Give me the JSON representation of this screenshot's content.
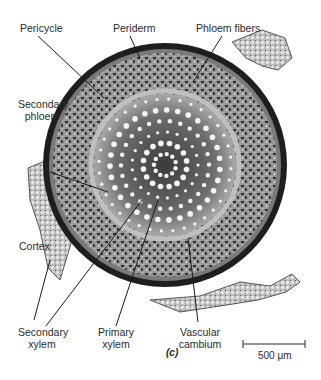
{
  "figure": {
    "panel_label": "(c)",
    "labels": {
      "pericycle": "Pericycle",
      "periderm": "Periderm",
      "phloem_fibers": "Phloem fibers",
      "secondary_phloem_l1": "Secondary",
      "secondary_phloem_l2": "phloem",
      "cortex": "Cortex",
      "secondary_xylem_l1": "Secondary",
      "secondary_xylem_l2": "xylem",
      "primary_xylem_l1": "Primary",
      "primary_xylem_l2": "xylem",
      "vascular_cambium_l1": "Vascular",
      "vascular_cambium_l2": "cambium"
    },
    "scale_bar": {
      "label": "500 μm"
    },
    "colors": {
      "ink": "#2a2a2a",
      "dark_tissue": "#1e1e1e",
      "mid_tissue": "#6a6a6a",
      "light_tissue": "#c8c8c8",
      "background": "#ffffff"
    }
  }
}
